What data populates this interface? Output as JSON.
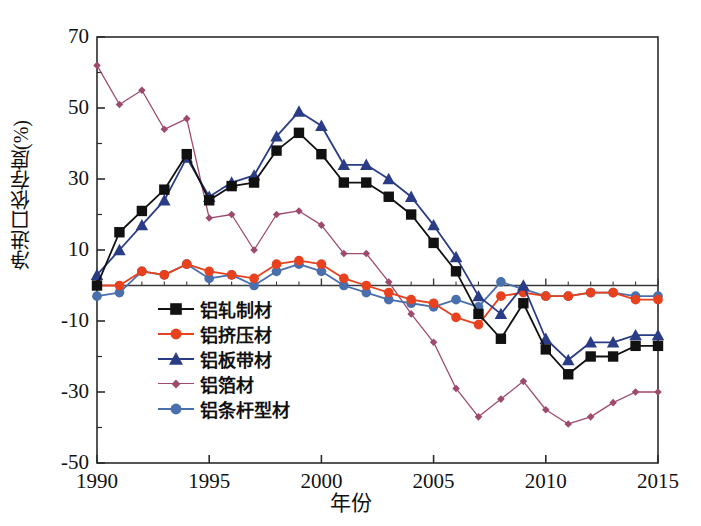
{
  "chart_data": {
    "type": "line",
    "title": "",
    "xlabel": "年份",
    "ylabel": "净进口依存度(%)",
    "xlim": [
      1990,
      2015
    ],
    "ylim": [
      -50,
      70
    ],
    "xticks": [
      1990,
      1995,
      2000,
      2005,
      2010,
      2015
    ],
    "yticks": [
      -50,
      -30,
      -10,
      10,
      30,
      50,
      70
    ],
    "ytick_labels": [
      "-50",
      "-30",
      "-10",
      "10",
      "30",
      "50",
      "70"
    ],
    "xtick_labels": [
      "1990",
      "1995",
      "2000",
      "2005",
      "2010",
      "2015"
    ],
    "grid": false,
    "legend_position": "lower-left-inside",
    "x": [
      1990,
      1991,
      1992,
      1993,
      1994,
      1995,
      1996,
      1997,
      1998,
      1999,
      2000,
      2001,
      2002,
      2003,
      2004,
      2005,
      2006,
      2007,
      2008,
      2009,
      2010,
      2011,
      2012,
      2013,
      2014,
      2015
    ],
    "series": [
      {
        "name": "铝轧制材",
        "color": "#111111",
        "marker": "square",
        "values": [
          0,
          15,
          21,
          27,
          37,
          24,
          28,
          29,
          38,
          43,
          37,
          29,
          29,
          25,
          20,
          12,
          4,
          -8,
          -15,
          -5,
          -18,
          -25,
          -20,
          -20,
          -17,
          -17
        ]
      },
      {
        "name": "铝挤压材",
        "color": "#E8411E",
        "marker": "circle",
        "values": [
          0,
          0,
          4,
          3,
          6,
          4,
          3,
          2,
          6,
          7,
          6,
          2,
          0,
          -2,
          -4,
          -5,
          -9,
          -11,
          -3,
          -2,
          -3,
          -3,
          -2,
          -2,
          -4,
          -4
        ]
      },
      {
        "name": "铝板带材",
        "color": "#2A3C86",
        "marker": "triangle",
        "values": [
          3,
          10,
          17,
          24,
          36,
          25,
          29,
          31,
          42,
          49,
          45,
          34,
          34,
          30,
          25,
          17,
          8,
          -3,
          -8,
          0,
          -15,
          -21,
          -16,
          -16,
          -14,
          -14
        ]
      },
      {
        "name": "铝箔材",
        "color": "#9E4A6E",
        "marker": "diamond",
        "values": [
          62,
          51,
          55,
          44,
          47,
          19,
          20,
          10,
          20,
          21,
          17,
          9,
          9,
          1,
          -8,
          -16,
          -29,
          -37,
          -32,
          -27,
          -35,
          -39,
          -37,
          -33,
          -30,
          -30
        ]
      },
      {
        "name": "铝条杆型材",
        "color": "#4A6FAD",
        "marker": "circle",
        "values": [
          -3,
          -2,
          4,
          3,
          6,
          2,
          3,
          0,
          4,
          6,
          4,
          0,
          -2,
          -4,
          -5,
          -6,
          -4,
          -6,
          1,
          -1,
          -3,
          -3,
          -2,
          -2,
          -3,
          -3
        ]
      }
    ]
  },
  "legend": {
    "items": [
      {
        "label": "铝轧制材"
      },
      {
        "label": "铝挤压材"
      },
      {
        "label": "铝板带材"
      },
      {
        "label": "铝箔材"
      },
      {
        "label": "铝条杆型材"
      }
    ]
  }
}
